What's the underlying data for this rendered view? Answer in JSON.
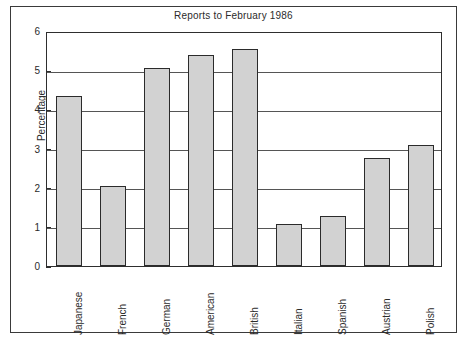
{
  "figure": {
    "frame_color": "#3a3a3a",
    "background": "#ffffff"
  },
  "axis": {
    "y_label": "Percentage",
    "y_ticks": [
      "6",
      "5",
      "4",
      "3",
      "2",
      "1",
      "0"
    ]
  },
  "chart_data": {
    "type": "bar",
    "title": "Reports to February 1986",
    "xlabel": "",
    "ylabel": "Percentage",
    "ylim": [
      0,
      6
    ],
    "yticks": [
      0,
      1,
      2,
      3,
      4,
      5,
      6
    ],
    "grid": true,
    "legend": null,
    "bar_fill": "#d2d2d2",
    "bar_edge": "#2b2b2b",
    "categories": [
      "Japanese",
      "French",
      "German",
      "American",
      "British",
      "Italian",
      "Spanish",
      "Austrian",
      "Polish"
    ],
    "values": [
      4.35,
      2.05,
      5.05,
      5.4,
      5.55,
      1.07,
      1.28,
      2.75,
      3.08
    ]
  }
}
